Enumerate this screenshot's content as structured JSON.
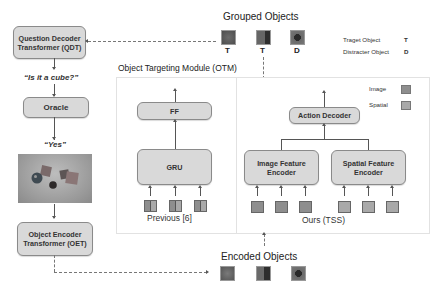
{
  "left_pipeline": {
    "qdt_label": "Question Decoder Transformer (QDT)",
    "qdt_line1": "Question Decoder",
    "qdt_line2": "Transformer (QDT)",
    "question_text": "“Is it a cube?”",
    "oracle_label": "Oracle",
    "answer_text": "“Yes”",
    "scene_image": "scene-with-cubes-and-spheres",
    "oet_line1": "Object Encoder",
    "oet_line2": "Transformer (OET)"
  },
  "grouped_objects": {
    "title": "Grouped Objects",
    "items": [
      {
        "tag": "T",
        "shape": "cube",
        "color": "#5a5a5a"
      },
      {
        "tag": "T",
        "shape": "cube",
        "color": "#4a4a4a"
      },
      {
        "tag": "D",
        "shape": "sphere",
        "color": "#3a3a3a"
      }
    ]
  },
  "legend_objects": {
    "target_label": "Traget Object",
    "target_tag": "T",
    "distracter_label": "Distracter Object",
    "distracter_tag": "D"
  },
  "otm": {
    "title": "Object Targeting Module (OTM)",
    "previous": {
      "ff_label": "FF",
      "gru_label": "GRU",
      "caption": "Previous [6]",
      "token_count": 3
    },
    "ours": {
      "action_decoder_label": "Action Decoder",
      "image_encoder_line1": "Image Feature",
      "image_encoder_line2": "Encoder",
      "spatial_encoder_line1": "Spatial Feature",
      "spatial_encoder_line2": "Encoder",
      "caption": "Ours (TSS)",
      "image_token_count": 3,
      "spatial_token_count": 3
    },
    "legend": {
      "image_label": "Image",
      "image_color": "#8e8e8e",
      "spatial_label": "Spatial",
      "spatial_color": "#a9a9a9"
    }
  },
  "encoded_objects": {
    "title": "Encoded Objects",
    "items": [
      {
        "shape": "cube",
        "color": "#6a6a6a"
      },
      {
        "shape": "cube",
        "color": "#4e4e4e"
      },
      {
        "shape": "sphere",
        "color": "#3e3e3e"
      }
    ]
  }
}
